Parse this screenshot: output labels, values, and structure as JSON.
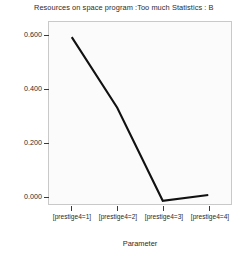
{
  "chart_data": {
    "type": "line",
    "title": "Resources on space program :Too much Statistics : B",
    "xlabel": "Parameter",
    "ylabel": "Values",
    "categories": [
      "[prestige4=1]",
      "[prestige4=2]",
      "[prestige4=3]",
      "[prestige4=4]"
    ],
    "values": [
      0.595,
      0.33,
      -0.02,
      0.002
    ],
    "series": [
      {
        "name": "Values",
        "values": [
          0.595,
          0.33,
          -0.02,
          0.002
        ]
      }
    ],
    "yticks": [
      "0.000",
      "0.200",
      "0.400",
      "0.600"
    ],
    "ytick_values": [
      0.0,
      0.2,
      0.4,
      0.6
    ],
    "ylim": [
      -0.032,
      0.652
    ],
    "grid": false,
    "legend": false,
    "line_color": "#111111",
    "plot_background": "#fbfbfb",
    "frame_color": "#c9c9c9"
  }
}
